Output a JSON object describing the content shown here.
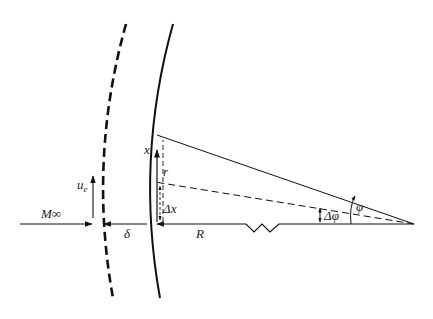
{
  "diagram": {
    "type": "geometry / fluid mechanics schematic",
    "labels": {
      "freestream_mach": "M∞",
      "edge_velocity": "u",
      "edge_velocity_sub": "e",
      "shock_standoff": "δ",
      "radius": "R",
      "surface_coord": "x",
      "local_radius": "r",
      "arc_increment": "Δx",
      "angle": "φ",
      "angle_increment": "Δφ"
    },
    "elements": [
      {
        "name": "shock-wave",
        "style": "thick dashed arc"
      },
      {
        "name": "body-surface",
        "style": "solid arc"
      },
      {
        "name": "freestream-arrow",
        "label": "M∞"
      },
      {
        "name": "edge-velocity-arrow",
        "label": "u_e"
      },
      {
        "name": "standoff-arrow",
        "label": "δ"
      },
      {
        "name": "radius-line",
        "label": "R",
        "style": "solid with break symbol"
      },
      {
        "name": "ray-phi",
        "style": "solid"
      },
      {
        "name": "ray-phi-minus-dphi",
        "style": "dashed"
      },
      {
        "name": "r-dimension",
        "label": "r",
        "style": "dashed vertical"
      },
      {
        "name": "dx-dimension",
        "label": "Δx"
      }
    ],
    "colors": {
      "line": "#111111",
      "background": "#ffffff"
    }
  }
}
